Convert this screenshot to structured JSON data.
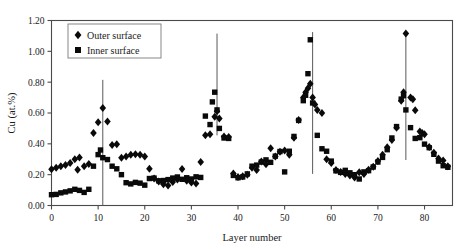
{
  "chart_data": {
    "type": "scatter",
    "title": "",
    "xlabel": "Layer number",
    "ylabel": "Cu (at.%)",
    "xlim": [
      0,
      86
    ],
    "ylim": [
      0.0,
      1.2
    ],
    "xticks": [
      0,
      10,
      20,
      30,
      40,
      50,
      60,
      70,
      80
    ],
    "xticklabels": [
      "0",
      "10",
      "20",
      "30",
      "40",
      "50",
      "60",
      "70",
      "80"
    ],
    "yticks": [
      0.0,
      0.2,
      0.4,
      0.6,
      0.8,
      1.0,
      1.2
    ],
    "yticklabels": [
      "0.00",
      "0.20",
      "0.40",
      "0.60",
      "0.80",
      "1.00",
      "1.20"
    ],
    "grid": false,
    "legend_position": "top-left",
    "vertical_lines": [
      11,
      35.5,
      56,
      76
    ],
    "series": [
      {
        "name": "Outer surface",
        "marker": "diamond",
        "color": "#0a0a0a",
        "points": [
          [
            0,
            0.235
          ],
          [
            1,
            0.245
          ],
          [
            2,
            0.255
          ],
          [
            3,
            0.262
          ],
          [
            4,
            0.275
          ],
          [
            5,
            0.3
          ],
          [
            5.6,
            0.232
          ],
          [
            6,
            0.312
          ],
          [
            7,
            0.255
          ],
          [
            8,
            0.27
          ],
          [
            9,
            0.47
          ],
          [
            10,
            0.54
          ],
          [
            11,
            0.632
          ],
          [
            12,
            0.545
          ],
          [
            13,
            0.392
          ],
          [
            14,
            0.398
          ],
          [
            15,
            0.31
          ],
          [
            16,
            0.318
          ],
          [
            17,
            0.33
          ],
          [
            18,
            0.332
          ],
          [
            19,
            0.33
          ],
          [
            20,
            0.318
          ],
          [
            21,
            0.238
          ],
          [
            22,
            0.175
          ],
          [
            23,
            0.155
          ],
          [
            24,
            0.138
          ],
          [
            25,
            0.13
          ],
          [
            26,
            0.152
          ],
          [
            27,
            0.168
          ],
          [
            28,
            0.236
          ],
          [
            29,
            0.16
          ],
          [
            30,
            0.15
          ],
          [
            31,
            0.142
          ],
          [
            32,
            0.282
          ],
          [
            33,
            0.455
          ],
          [
            34,
            0.462
          ],
          [
            35,
            0.575
          ],
          [
            35.5,
            0.612
          ],
          [
            36,
            0.565
          ],
          [
            37,
            0.448
          ],
          [
            38,
            0.445
          ],
          [
            39,
            0.208
          ],
          [
            40,
            0.185
          ],
          [
            41,
            0.19
          ],
          [
            42,
            0.2
          ],
          [
            43,
            0.245
          ],
          [
            44,
            0.23
          ],
          [
            45,
            0.285
          ],
          [
            46,
            0.268
          ],
          [
            47,
            0.372
          ],
          [
            48,
            0.318
          ],
          [
            49,
            0.348
          ],
          [
            50,
            0.356
          ],
          [
            51,
            0.33
          ],
          [
            52,
            0.44
          ],
          [
            53,
            0.555
          ],
          [
            54,
            0.7
          ],
          [
            54.5,
            0.735
          ],
          [
            55,
            0.76
          ],
          [
            55.5,
            0.79
          ],
          [
            56,
            0.7
          ],
          [
            56.5,
            0.655
          ],
          [
            57,
            0.62
          ],
          [
            58,
            0.6
          ],
          [
            59,
            0.3
          ],
          [
            60,
            0.275
          ],
          [
            61,
            0.23
          ],
          [
            62,
            0.218
          ],
          [
            63,
            0.205
          ],
          [
            64,
            0.195
          ],
          [
            65,
            0.182
          ],
          [
            66,
            0.215
          ],
          [
            67,
            0.205
          ],
          [
            68,
            0.232
          ],
          [
            69,
            0.252
          ],
          [
            70,
            0.288
          ],
          [
            71,
            0.33
          ],
          [
            72,
            0.378
          ],
          [
            73,
            0.425
          ],
          [
            74,
            0.505
          ],
          [
            75,
            0.68
          ],
          [
            75.5,
            0.735
          ],
          [
            76,
            1.115
          ],
          [
            77,
            0.7
          ],
          [
            77.5,
            0.69
          ],
          [
            78,
            0.618
          ],
          [
            79,
            0.48
          ],
          [
            79.5,
            0.47
          ],
          [
            80,
            0.462
          ],
          [
            81,
            0.38
          ],
          [
            82,
            0.342
          ],
          [
            83,
            0.305
          ],
          [
            84,
            0.292
          ],
          [
            85,
            0.255
          ]
        ]
      },
      {
        "name": "Inner surface",
        "marker": "square",
        "color": "#0a0a0a",
        "points": [
          [
            0,
            0.07
          ],
          [
            1,
            0.072
          ],
          [
            2,
            0.082
          ],
          [
            3,
            0.088
          ],
          [
            4,
            0.095
          ],
          [
            5,
            0.105
          ],
          [
            6,
            0.098
          ],
          [
            7,
            0.085
          ],
          [
            8,
            0.105
          ],
          [
            9,
            0.255
          ],
          [
            10,
            0.33
          ],
          [
            10.5,
            0.36
          ],
          [
            11,
            0.31
          ],
          [
            12,
            0.298
          ],
          [
            13,
            0.255
          ],
          [
            14,
            0.238
          ],
          [
            15,
            0.2
          ],
          [
            16,
            0.148
          ],
          [
            17,
            0.14
          ],
          [
            18,
            0.15
          ],
          [
            19,
            0.145
          ],
          [
            20,
            0.132
          ],
          [
            21,
            0.175
          ],
          [
            22,
            0.178
          ],
          [
            23,
            0.16
          ],
          [
            24,
            0.162
          ],
          [
            25,
            0.168
          ],
          [
            26,
            0.178
          ],
          [
            27,
            0.185
          ],
          [
            28,
            0.17
          ],
          [
            29,
            0.18
          ],
          [
            30,
            0.172
          ],
          [
            31,
            0.186
          ],
          [
            32,
            0.182
          ],
          [
            33,
            0.58
          ],
          [
            34,
            0.525
          ],
          [
            34.5,
            0.672
          ],
          [
            35,
            0.735
          ],
          [
            35.5,
            0.62
          ],
          [
            36,
            0.5
          ],
          [
            37,
            0.438
          ],
          [
            38,
            0.435
          ],
          [
            39,
            0.195
          ],
          [
            40,
            0.18
          ],
          [
            41,
            0.185
          ],
          [
            42,
            0.205
          ],
          [
            43,
            0.255
          ],
          [
            44,
            0.262
          ],
          [
            45,
            0.282
          ],
          [
            46,
            0.296
          ],
          [
            47,
            0.28
          ],
          [
            48,
            0.32
          ],
          [
            49,
            0.35
          ],
          [
            50,
            0.218
          ],
          [
            51,
            0.352
          ],
          [
            52,
            0.448
          ],
          [
            53,
            0.552
          ],
          [
            54,
            0.68
          ],
          [
            54.5,
            0.715
          ],
          [
            55,
            0.855
          ],
          [
            55.5,
            1.075
          ],
          [
            56,
            0.665
          ],
          [
            57,
            0.455
          ],
          [
            58,
            0.368
          ],
          [
            59,
            0.352
          ],
          [
            60,
            0.288
          ],
          [
            61,
            0.225
          ],
          [
            62,
            0.215
          ],
          [
            63,
            0.228
          ],
          [
            64,
            0.212
          ],
          [
            65,
            0.2
          ],
          [
            66,
            0.172
          ],
          [
            67,
            0.218
          ],
          [
            68,
            0.226
          ],
          [
            69,
            0.25
          ],
          [
            70,
            0.282
          ],
          [
            71,
            0.312
          ],
          [
            72,
            0.362
          ],
          [
            73,
            0.438
          ],
          [
            74,
            0.512
          ],
          [
            75,
            0.69
          ],
          [
            75.5,
            0.712
          ],
          [
            76,
            0.62
          ],
          [
            77,
            0.505
          ],
          [
            78,
            0.435
          ],
          [
            79,
            0.44
          ],
          [
            80,
            0.398
          ],
          [
            81,
            0.375
          ],
          [
            82,
            0.332
          ],
          [
            83,
            0.288
          ],
          [
            84,
            0.258
          ],
          [
            85,
            0.248
          ]
        ]
      }
    ]
  },
  "legend": {
    "items": [
      {
        "label": "Outer surface",
        "marker": "diamond"
      },
      {
        "label": "Inner surface",
        "marker": "square"
      }
    ]
  }
}
